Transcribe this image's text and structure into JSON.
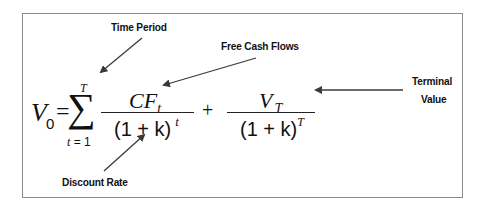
{
  "diagram": {
    "labels": {
      "time_period": "Time Period",
      "free_cash_flows": "Free Cash Flows",
      "terminal_value_line1": "Terminal",
      "terminal_value_line2": "Value",
      "discount_rate": "Discount Rate"
    },
    "formula": {
      "lhs_symbol": "V",
      "lhs_subscript": "0",
      "equals": "=",
      "sum_symbol": "∑",
      "sum_upper": "T",
      "sum_lower": "t = 1",
      "term1_numerator_main": "CF",
      "term1_numerator_sub": "t",
      "term1_denominator_base": "(1 + k)",
      "term1_denominator_exp": "t",
      "plus": "+",
      "term2_numerator_main": "V",
      "term2_numerator_sub": "T",
      "term2_denominator_base": "(1 + k)",
      "term2_denominator_exp": "T"
    },
    "colors": {
      "border": "#8a8a8a",
      "arrow": "#3a3a3a",
      "text": "#111111"
    }
  }
}
